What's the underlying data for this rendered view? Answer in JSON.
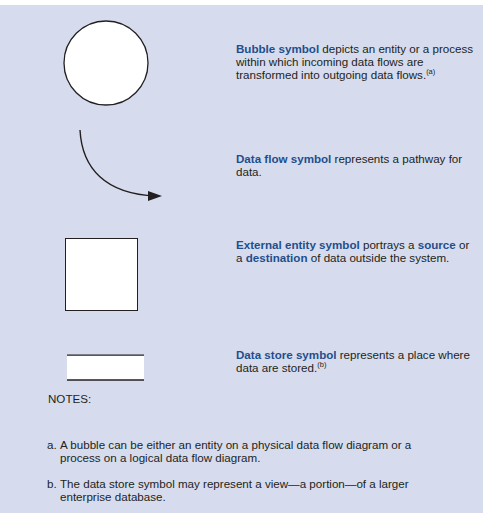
{
  "colors": {
    "panel_background": "#d6dcee",
    "keyword": "#1f4e8c",
    "text": "#231f20",
    "symbol_stroke": "#231f20",
    "symbol_fill": "#ffffff"
  },
  "symbols": [
    {
      "shape": "circle",
      "keyword": "Bubble symbol",
      "text": " depicts an entity or a process within which incoming data flows are transformed into outgoing data flows.",
      "footnote_ref": "(a)"
    },
    {
      "shape": "curved-arrow",
      "keyword": "Data flow symbol",
      "text": " represents a pathway for data."
    },
    {
      "shape": "square",
      "keyword": "External entity symbol",
      "text_1": " portrays a ",
      "keyword_2": "source",
      "text_2": " or a ",
      "keyword_3": "destination",
      "text_3": " of data outside the system."
    },
    {
      "shape": "open-rectangle",
      "keyword": "Data store symbol",
      "text": " represents a place where data are stored.",
      "footnote_ref": "(b)"
    }
  ],
  "notes": {
    "title": "NOTES:",
    "items": [
      {
        "label": "a.",
        "text": "A bubble can be either an entity on a physical data flow diagram or a process on a logical data flow diagram."
      },
      {
        "label": "b.",
        "text": "The data store symbol may represent a view—a portion—of a larger enterprise database."
      }
    ]
  }
}
